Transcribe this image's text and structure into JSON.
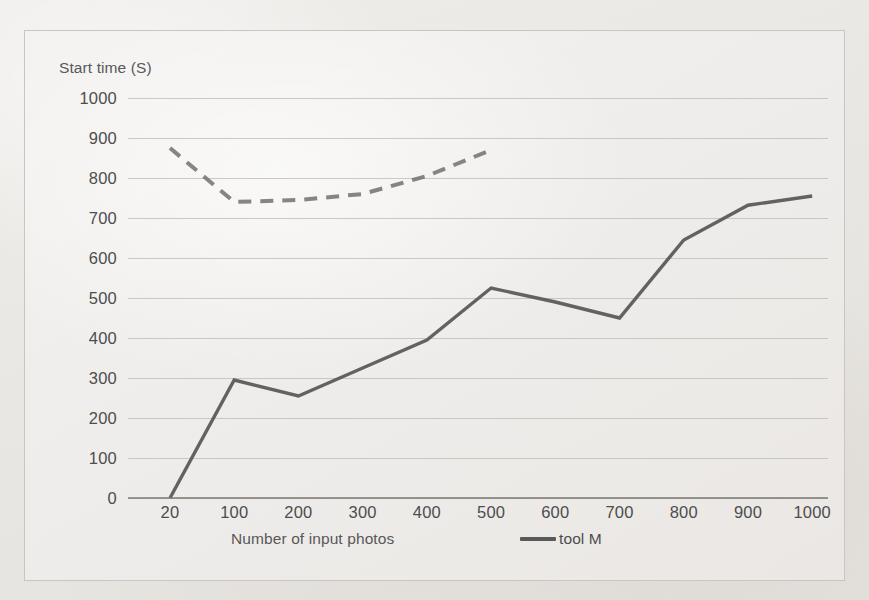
{
  "chart_data": {
    "type": "line",
    "title": "",
    "xlabel": "Number of input photos",
    "ylabel": "Start time (S)",
    "categories": [
      "20",
      "100",
      "200",
      "300",
      "400",
      "500",
      "600",
      "700",
      "800",
      "900",
      "1000"
    ],
    "ylim": [
      0,
      1000
    ],
    "y_ticks": [
      "1000",
      "900",
      "800",
      "700",
      "600",
      "500",
      "400",
      "300",
      "200",
      "100",
      "0"
    ],
    "grid": true,
    "legend_position": "bottom-right",
    "series": [
      {
        "name": "tool M",
        "style": "solid",
        "color": "#595959",
        "values": [
          0,
          295,
          255,
          325,
          395,
          525,
          490,
          450,
          645,
          732,
          755
        ]
      },
      {
        "name": "",
        "style": "dashed",
        "color": "#6b6b6b",
        "values": [
          875,
          740,
          745,
          760,
          805,
          870,
          null,
          null,
          null,
          null,
          null
        ]
      }
    ]
  },
  "axes": {
    "y_title": "Start time (S)",
    "x_title": "Number of input photos"
  },
  "legend": {
    "entries": [
      {
        "label": "tool M",
        "swatch": "solid-line-swatch",
        "color": "#595959"
      }
    ]
  },
  "scan_artifacts": {
    "ghost_rows": [
      {
        "text": "уоб",
        "left": 818,
        "top": 38,
        "size": 15
      },
      {
        "text": "s",
        "left": 824,
        "top": 168,
        "size": 15
      },
      {
        "text": "г е т г о т     м     е г     т в т г о т",
        "left": 118,
        "top": 233,
        "size": 15
      },
      {
        "text": "оатбер тиот оатбг",
        "left": 318,
        "top": 272,
        "size": 15
      },
      {
        "text": "г о т       м о г т в",
        "left": 300,
        "top": 360,
        "size": 15
      },
      {
        "text": "твтго те р твтготе тг твтго",
        "left": 180,
        "top": 422,
        "size": 15
      },
      {
        "text": "т т т о т   т т о о т   т",
        "left": 540,
        "top": 230,
        "size": 15
      },
      {
        "text": "тооб",
        "left": 810,
        "top": 560,
        "size": 15
      }
    ]
  }
}
